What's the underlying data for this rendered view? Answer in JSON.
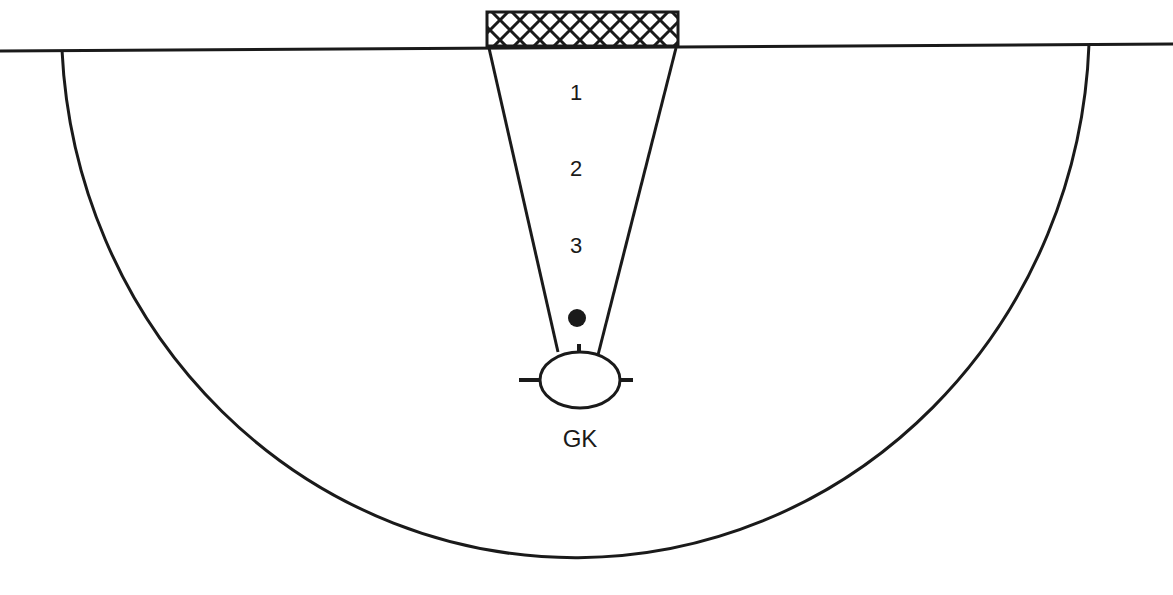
{
  "diagram": {
    "type": "goalkeeper-drill",
    "stroke_color": "#1a1a1a",
    "positions": [
      {
        "label": "1",
        "x": 576,
        "y": 80
      },
      {
        "label": "2",
        "x": 576,
        "y": 156
      },
      {
        "label": "3",
        "x": 576,
        "y": 233
      }
    ],
    "goalkeeper": {
      "label": "GK",
      "x": 580,
      "y": 425
    },
    "ball": {
      "x": 577,
      "y": 318
    }
  }
}
